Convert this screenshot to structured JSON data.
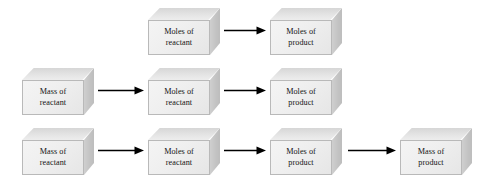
{
  "diagram": {
    "width": 497,
    "height": 177,
    "background_color": "#ffffff",
    "box_fill_front": "#efefef",
    "box_fill_top": "#e4e4e4",
    "box_fill_side": "#c3c3c3",
    "box_border_color": "#b9b9b9",
    "text_color": "#141414",
    "arrow_color": "#000000"
  },
  "rows": [
    {
      "id": "row-1",
      "top": 8,
      "boxes": [
        {
          "id": "r1-b1",
          "left": 148,
          "line1": "Moles of",
          "line2": "reactant"
        },
        {
          "id": "r1-b2",
          "left": 270,
          "line1": "Moles of",
          "line2": "product"
        }
      ],
      "arrows": [
        {
          "id": "r1-a1",
          "left": 224,
          "top": 26,
          "length": 42
        }
      ]
    },
    {
      "id": "row-2",
      "top": 68,
      "boxes": [
        {
          "id": "r2-b1",
          "left": 22,
          "line1": "Mass of",
          "line2": "reactant"
        },
        {
          "id": "r2-b2",
          "left": 148,
          "line1": "Moles of",
          "line2": "reactant"
        },
        {
          "id": "r2-b3",
          "left": 270,
          "line1": "Moles of",
          "line2": "product"
        }
      ],
      "arrows": [
        {
          "id": "r2-a1",
          "left": 98,
          "top": 86,
          "length": 46
        },
        {
          "id": "r2-a2",
          "left": 224,
          "top": 86,
          "length": 42
        }
      ]
    },
    {
      "id": "row-3",
      "top": 128,
      "boxes": [
        {
          "id": "r3-b1",
          "left": 22,
          "line1": "Mass of",
          "line2": "reactant"
        },
        {
          "id": "r3-b2",
          "left": 148,
          "line1": "Moles of",
          "line2": "reactant"
        },
        {
          "id": "r3-b3",
          "left": 270,
          "line1": "Moles of",
          "line2": "product"
        },
        {
          "id": "r3-b4",
          "left": 400,
          "line1": "Mass of",
          "line2": "product"
        }
      ],
      "arrows": [
        {
          "id": "r3-a1",
          "left": 98,
          "top": 146,
          "length": 46
        },
        {
          "id": "r3-a2",
          "left": 224,
          "top": 146,
          "length": 42
        },
        {
          "id": "r3-a3",
          "left": 348,
          "top": 146,
          "length": 48
        }
      ]
    }
  ]
}
